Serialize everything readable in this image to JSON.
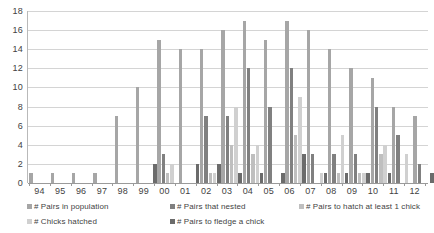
{
  "chart_data": {
    "type": "bar",
    "title": "",
    "subtitle": "",
    "xlabel": "",
    "ylabel": "",
    "ylim": [
      0,
      18
    ],
    "ytick_step": 2,
    "yticks": [
      18,
      16,
      14,
      12,
      10,
      8,
      6,
      4,
      2,
      0
    ],
    "grid": true,
    "legend_position": "bottom",
    "categories": [
      "94",
      "95",
      "96",
      "97",
      "98",
      "99",
      "00",
      "01",
      "02",
      "03",
      "04",
      "05",
      "06",
      "07",
      "08",
      "09",
      "10",
      "11",
      "12"
    ],
    "series": [
      {
        "name": "# Pairs in population",
        "color": "#a6a6a6",
        "values": [
          1,
          1,
          1,
          1,
          7,
          10,
          15,
          14,
          14,
          16,
          17,
          15,
          17,
          16,
          14,
          12,
          11,
          8,
          7
        ]
      },
      {
        "name": "# Pairs that nested",
        "color": "#808080",
        "values": [
          0,
          0,
          0,
          0,
          0,
          0,
          3,
          0,
          7,
          7,
          12,
          8,
          12,
          3,
          3,
          3,
          8,
          5,
          2
        ]
      },
      {
        "name": "# Pairs to hatch at least 1 chick",
        "color": "#bfbfbf",
        "values": [
          0,
          0,
          0,
          0,
          0,
          0,
          1,
          0,
          1,
          4,
          3,
          0,
          5,
          0,
          1,
          1,
          3,
          0,
          0
        ]
      },
      {
        "name": "# Chicks hatched",
        "color": "#d0d0d0",
        "values": [
          0,
          0,
          0,
          0,
          0,
          0,
          2,
          0,
          1,
          8,
          4,
          0,
          9,
          1,
          5,
          1,
          4,
          3,
          0
        ]
      },
      {
        "name": "# Pairs to fledge a chick",
        "color": "#6b6b6b",
        "values": [
          0,
          0,
          0,
          0,
          0,
          2,
          0,
          2,
          2,
          1,
          1,
          1,
          3,
          1,
          1,
          1,
          1,
          0,
          1
        ]
      }
    ]
  },
  "legend": {
    "items": [
      {
        "label": "# Pairs in population",
        "color": "#a6a6a6"
      },
      {
        "label": "# Pairs that nested",
        "color": "#808080"
      },
      {
        "label": "# Pairs to hatch at least 1 chick",
        "color": "#bfbfbf"
      },
      {
        "label": "# Chicks hatched",
        "color": "#d0d0d0"
      },
      {
        "label": "# Pairs to fledge a chick",
        "color": "#6b6b6b"
      }
    ]
  }
}
